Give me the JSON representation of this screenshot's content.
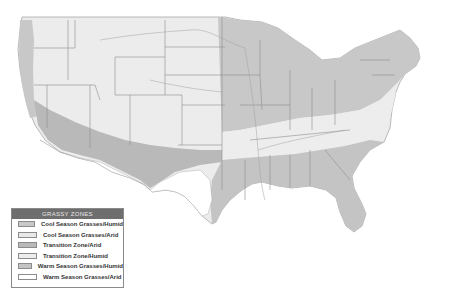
{
  "map": {
    "title": "Grassy Zones of the United States",
    "region": "Contiguous United States"
  },
  "legend": {
    "title": "GRASSY ZONES",
    "items": [
      {
        "label": "Cool Season Grasses/Humid",
        "color": "#c8c8c8"
      },
      {
        "label": "Cool Season Grasses/Arid",
        "color": "#e8e8e8"
      },
      {
        "label": "Transition Zone/Arid",
        "color": "#b9b9b9"
      },
      {
        "label": "Transition Zone/Humid",
        "color": "#ededed"
      },
      {
        "label": "Warm Season Grasses/Humid",
        "color": "#c4c4c4"
      },
      {
        "label": "Warm Season Grasses/Arid",
        "color": "#ffffff"
      }
    ]
  }
}
